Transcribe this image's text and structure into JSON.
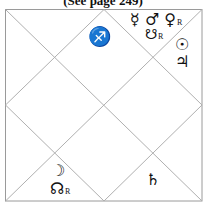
{
  "caption": "(See page 249)",
  "chart": {
    "style": "North Indian diamond chart",
    "frame": {
      "x1": 5,
      "y1": 9,
      "x2": 202,
      "y2": 201
    },
    "line_color": "#b0b0b0",
    "frame_color": "#9a9a9a"
  },
  "houses": {
    "top_center": {
      "sign_glyph": "♐",
      "sign_name": "Sagittarius"
    },
    "top_right": {
      "line1": [
        {
          "glyph": "☿",
          "name": "Mercury",
          "retro": ""
        },
        {
          "glyph": "♂",
          "name": "Mars",
          "retro": ""
        },
        {
          "glyph": "♀",
          "name": "Venus",
          "retro": "R"
        }
      ],
      "line2": [
        {
          "glyph": "☋",
          "name": "Ketu",
          "retro": "R"
        }
      ]
    },
    "right_upper": {
      "line1": [
        {
          "glyph": "☉",
          "name": "Sun",
          "retro": ""
        }
      ],
      "line2": [
        {
          "glyph": "♃",
          "name": "Jupiter",
          "retro": ""
        }
      ]
    },
    "bottom_left": {
      "line1": [
        {
          "glyph": "☽",
          "name": "Moon",
          "retro": ""
        }
      ],
      "line2": [
        {
          "glyph": "☊",
          "name": "Rahu",
          "retro": "R"
        }
      ]
    },
    "bottom_center_right": {
      "line1": [
        {
          "glyph": "♄",
          "name": "Saturn",
          "retro": ""
        }
      ]
    }
  }
}
